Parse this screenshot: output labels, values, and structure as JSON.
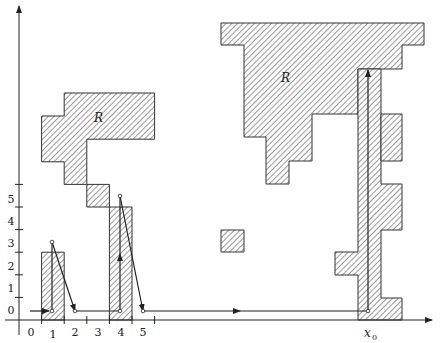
{
  "figure": {
    "width": 440,
    "height": 343,
    "colors": {
      "ink": "#222222",
      "hatch": "#444444",
      "background": "#ffffff"
    },
    "grid": {
      "origin_x": 19,
      "origin_y": 320,
      "cell": 22.6
    },
    "x_axis": {
      "tick_labels": [
        "0",
        "1",
        "2",
        "3",
        "4",
        "5"
      ],
      "special_label": "x",
      "special_label_subscript": "0",
      "special_label_col": 15.5
    },
    "y_axis": {
      "tick_labels": [
        "0",
        "1",
        "2",
        "3",
        "4",
        "5"
      ]
    },
    "region_labels": [
      {
        "text": "R",
        "col": 4.5,
        "row": 9.5
      },
      {
        "text": "R",
        "col": 10.5,
        "row": 12
      }
    ],
    "regions": [
      {
        "name": "left-bottom-bar",
        "cells": [
          [
            1,
            0
          ],
          [
            1,
            1
          ],
          [
            1,
            2
          ]
        ]
      },
      {
        "name": "left-staircase",
        "cells": [
          [
            4,
            0
          ],
          [
            4,
            1
          ],
          [
            4,
            2
          ],
          [
            4,
            3
          ],
          [
            4,
            4
          ],
          [
            3,
            5
          ],
          [
            2,
            6
          ],
          [
            2,
            7
          ],
          [
            1,
            8
          ],
          [
            1,
            9
          ],
          [
            2,
            8
          ],
          [
            2,
            9
          ],
          [
            2,
            10
          ],
          [
            3,
            8
          ],
          [
            3,
            9
          ],
          [
            3,
            10
          ],
          [
            4,
            9
          ],
          [
            4,
            10
          ],
          [
            5,
            9
          ],
          [
            5,
            10
          ]
        ]
      },
      {
        "name": "small-square",
        "cells": [
          [
            9,
            3
          ]
        ]
      },
      {
        "name": "right-R",
        "cells": []
      },
      {
        "name": "right-column",
        "cells": []
      }
    ],
    "path_points": [
      {
        "label": "start",
        "col": 0.5,
        "row": 0.5
      },
      {
        "label": "p1",
        "col": 1.5,
        "row": 0.5
      },
      {
        "label": "p2",
        "col": 1.5,
        "row": 3.5
      },
      {
        "label": "p3",
        "col": 2.5,
        "row": 0.5
      },
      {
        "label": "p4",
        "col": 4.5,
        "row": 0.5
      },
      {
        "label": "p5",
        "col": 4.5,
        "row": 5.5
      },
      {
        "label": "p6",
        "col": 5.5,
        "row": 0.5
      },
      {
        "label": "x0-point",
        "col": 15.5,
        "row": 0.5
      },
      {
        "label": "top",
        "col": 15.5,
        "row": 13.3
      }
    ]
  }
}
